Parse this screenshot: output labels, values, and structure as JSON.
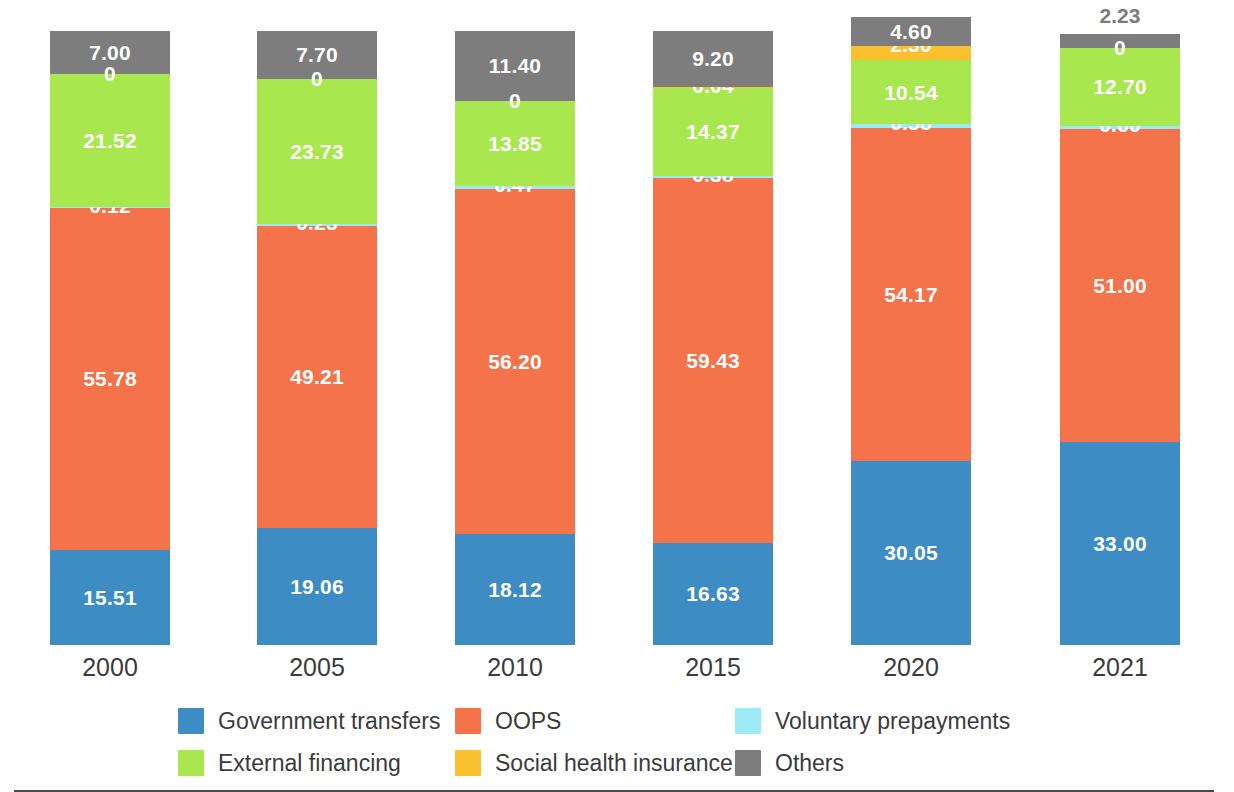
{
  "chart_data": {
    "type": "bar",
    "stacked": true,
    "title": "",
    "subtitle": "",
    "xlabel": "",
    "ylabel": "",
    "ylim": [
      0,
      100
    ],
    "grid": false,
    "legend_position": "bottom",
    "categories": [
      "2000",
      "2005",
      "2010",
      "2015",
      "2020",
      "2021"
    ],
    "series": [
      {
        "name": "Government transfers",
        "color": "#3d8dc4",
        "values": [
          15.51,
          19.06,
          18.12,
          16.63,
          30.05,
          33.0
        ],
        "labels": [
          "15.51",
          "19.06",
          "18.12",
          "16.63",
          "30.05",
          "33.00"
        ]
      },
      {
        "name": "OOPS",
        "color": "#f4734a",
        "values": [
          55.78,
          49.21,
          56.2,
          59.43,
          54.17,
          51.0
        ],
        "labels": [
          "55.78",
          "49.21",
          "56.20",
          "59.43",
          "54.17",
          "51.00"
        ]
      },
      {
        "name": "Voluntary prepayments",
        "color": "#9ceaf5",
        "values": [
          0.12,
          0.25,
          0.47,
          0.38,
          0.58,
          0.6
        ],
        "labels": [
          "0.12",
          "0.25",
          "0.47",
          "0.38",
          "0.58",
          "0.60"
        ]
      },
      {
        "name": "External financing",
        "color": "#a8e84e",
        "values": [
          21.52,
          23.73,
          13.85,
          14.37,
          10.54,
          12.7
        ],
        "labels": [
          "21.52",
          "23.73",
          "13.85",
          "14.37",
          "10.54",
          "12.70"
        ]
      },
      {
        "name": "Social health insurance",
        "color": "#fcc council",
        "values": [
          0,
          0,
          0,
          0.04,
          2.3,
          0
        ],
        "labels": [
          "0",
          "0",
          "0",
          "0.04",
          "2.30",
          "0"
        ]
      },
      {
        "name": "Others",
        "color": "#7d7d7d",
        "values": [
          7.0,
          7.7,
          11.4,
          9.2,
          4.6,
          2.23
        ],
        "labels": [
          "7.00",
          "7.70",
          "11.40",
          "9.20",
          "4.60",
          "2.23"
        ]
      }
    ]
  },
  "colors": {
    "government_transfers": "#3d8dc4",
    "oops": "#f4734a",
    "voluntary_prepayments": "#9ceaf5",
    "external_financing": "#a8e84e",
    "social_health_insurance": "#fbc02d",
    "others": "#7d7d7d",
    "axis": "#4a4a4a",
    "tick_text": "#3b3b3b",
    "outside_label": "#7b7b7b"
  },
  "legend": {
    "items": [
      {
        "label": "Government transfers",
        "color": "#3d8dc4"
      },
      {
        "label": "OOPS",
        "color": "#f4734a"
      },
      {
        "label": "Voluntary prepayments",
        "color": "#9ceaf5"
      },
      {
        "label": "External financing",
        "color": "#a8e84e"
      },
      {
        "label": "Social health insurance",
        "color": "#fbc02d"
      },
      {
        "label": "Others",
        "color": "#7d7d7d"
      }
    ]
  },
  "axis": {
    "ticks": [
      "2000",
      "2005",
      "2010",
      "2015",
      "2020",
      "2021"
    ]
  }
}
